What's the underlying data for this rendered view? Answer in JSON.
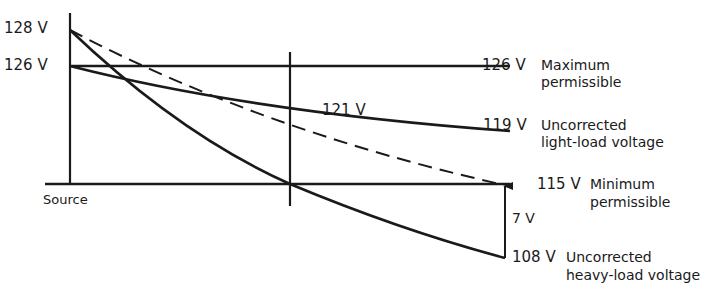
{
  "diagram": {
    "axis_labels": {
      "v128": "128 V",
      "v126": "126 V",
      "source": "Source"
    },
    "midpoint_label": "121 V",
    "right_labels": [
      {
        "value": "126 V",
        "line1": "Maximum",
        "line2": "permissible"
      },
      {
        "value": "119 V",
        "line1": "Uncorrected",
        "line2": "light-load voltage"
      },
      {
        "value": "115 V",
        "line1": "Minimum",
        "line2": "permissible"
      },
      {
        "value": "108 V",
        "line1": "Uncorrected",
        "line2": "heavy-load voltage"
      }
    ],
    "difference_label": "7 V",
    "colors": {
      "line": "#1a1a1a",
      "background": "#ffffff"
    }
  }
}
